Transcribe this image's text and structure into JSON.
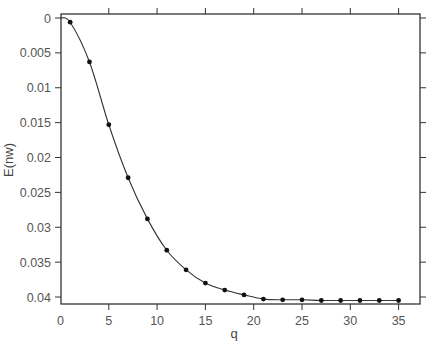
{
  "chart_data": {
    "type": "line",
    "title": "",
    "xlabel": "q",
    "ylabel": "E(nw)",
    "x": [
      1,
      3,
      5,
      7,
      9,
      11,
      13,
      15,
      17,
      19,
      21,
      23,
      25,
      27,
      29,
      31,
      33,
      35
    ],
    "series": [
      {
        "name": "E(nw)",
        "markers": true,
        "line": true,
        "values": [
          0.0006,
          0.0063,
          0.0153,
          0.0229,
          0.0288,
          0.0333,
          0.0361,
          0.038,
          0.039,
          0.0397,
          0.0403,
          0.0404,
          0.0404,
          0.0405,
          0.0405,
          0.0405,
          0.0405,
          0.0405
        ]
      }
    ],
    "curve_start": {
      "x": 0,
      "y": 0
    },
    "xlim": [
      0,
      37
    ],
    "ylim": [
      0,
      0.041
    ],
    "y_inverted": true,
    "xticks": [
      0,
      5,
      10,
      15,
      20,
      25,
      30,
      35
    ],
    "xtick_labels": [
      "0",
      "5",
      "10",
      "15",
      "20",
      "25",
      "30",
      "35"
    ],
    "yticks": [
      0,
      0.005,
      0.01,
      0.015,
      0.02,
      0.025,
      0.03,
      0.035,
      0.04
    ],
    "ytick_labels": [
      "0",
      "0.005",
      "0.01",
      "0.015",
      "0.02",
      "0.025",
      "0.03",
      "0.035",
      "0.04"
    ],
    "grid": false,
    "legend": null,
    "colors": {
      "line": "#333333",
      "marker": "#111111",
      "frame": "#333333",
      "text": "#555555"
    }
  }
}
